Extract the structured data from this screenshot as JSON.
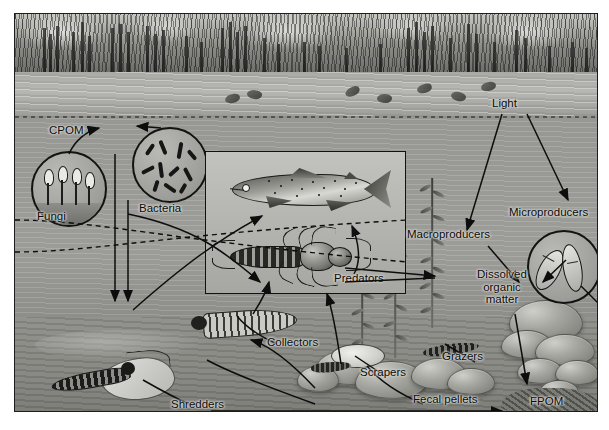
{
  "figure": {
    "domain": "diagram",
    "type": "stream-ecosystem-energy-flow",
    "title": "",
    "frame": {
      "border_color": "#1d1d1d",
      "background": "#9c9c99"
    }
  },
  "labels": {
    "cpom": "CPOM",
    "fungi": "Fungi",
    "bacteria": "Bacteria",
    "light": "Light",
    "macroproducers": "Macroproducers",
    "microproducers": "Microproducers",
    "dissolved_organic_matter": "Dissolved organic matter",
    "dissolved_line1": "Dissolved",
    "dissolved_line2": "organic",
    "dissolved_line3": "matter",
    "predators": "Predators",
    "collectors": "Collectors",
    "shredders": "Shredders",
    "scrapers": "Scrapers",
    "grazers": "Grazers",
    "fecal_pellets": "Fecal pellets",
    "fpom": "FPOM"
  },
  "nodes": [
    {
      "id": "light",
      "label": "Light",
      "x": 505,
      "y": 103,
      "kind": "text-label"
    },
    {
      "id": "cpom",
      "label": "CPOM",
      "x": 63,
      "y": 129,
      "kind": "text-label"
    },
    {
      "id": "fungi",
      "label": "Fungi",
      "x": 50,
      "y": 215,
      "kind": "circle-inset"
    },
    {
      "id": "bacteria",
      "label": "Bacteria",
      "x": 159,
      "y": 190,
      "kind": "circle-inset"
    },
    {
      "id": "macroproducers",
      "label": "Macroproducers",
      "x": 448,
      "y": 233,
      "kind": "text-label"
    },
    {
      "id": "microproducers",
      "label": "Microproducers",
      "x": 545,
      "y": 208,
      "kind": "circle-inset"
    },
    {
      "id": "dom",
      "label": "Dissolved organic matter",
      "x": 489,
      "y": 277,
      "kind": "text-label"
    },
    {
      "id": "predators",
      "label": "Predators",
      "x": 362,
      "y": 277,
      "kind": "box-inset"
    },
    {
      "id": "collectors",
      "label": "Collectors",
      "x": 295,
      "y": 341,
      "kind": "text-label"
    },
    {
      "id": "shredders",
      "label": "Shredders",
      "x": 196,
      "y": 404,
      "kind": "text-label"
    },
    {
      "id": "scrapers",
      "label": "Scrapers",
      "x": 385,
      "y": 371,
      "kind": "text-label"
    },
    {
      "id": "grazers",
      "label": "Grazers",
      "x": 464,
      "y": 355,
      "kind": "text-label"
    },
    {
      "id": "fecal_pellets",
      "label": "Fecal pellets",
      "x": 450,
      "y": 397,
      "kind": "text-label"
    },
    {
      "id": "fpom",
      "label": "FPOM",
      "x": 555,
      "y": 400,
      "kind": "text-label"
    }
  ],
  "flows": [
    {
      "from": "fungi",
      "to": "cpom",
      "style": "solid"
    },
    {
      "from": "bacteria",
      "to": "cpom",
      "style": "solid"
    },
    {
      "from": "cpom",
      "to": "shredders",
      "style": "solid"
    },
    {
      "from": "bacteria",
      "to": "collectors",
      "style": "solid"
    },
    {
      "from": "shredders",
      "to": "predators",
      "style": "solid"
    },
    {
      "from": "collectors",
      "to": "predators",
      "style": "solid"
    },
    {
      "from": "scrapers",
      "to": "predators",
      "style": "solid"
    },
    {
      "from": "light",
      "to": "macroproducers",
      "style": "solid"
    },
    {
      "from": "light",
      "to": "microproducers",
      "style": "solid"
    },
    {
      "from": "macroproducers",
      "to": "dom",
      "style": "solid"
    },
    {
      "from": "microproducers",
      "to": "dom",
      "style": "solid"
    },
    {
      "from": "dom",
      "to": "fpom",
      "style": "solid"
    },
    {
      "from": "macroproducers",
      "to": "grazers",
      "style": "solid"
    },
    {
      "from": "fecal_pellets",
      "to": "fpom",
      "style": "solid"
    },
    {
      "from": "predators",
      "to": "fish",
      "style": "dashed"
    }
  ],
  "inset": {
    "fish_label": "",
    "predator_label": "Predators",
    "border_color": "#111111"
  }
}
